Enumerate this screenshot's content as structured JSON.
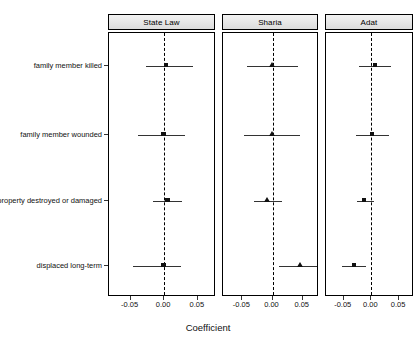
{
  "chart_data": {
    "type": "scatter",
    "title": "",
    "xlabel": "Coefficient",
    "ylabel": "",
    "xlim": [
      -0.082,
      0.077
    ],
    "xticks": [
      -0.05,
      0.0,
      0.05
    ],
    "xticklabels": [
      "-0.05",
      "0.00",
      "0.05"
    ],
    "grid": false,
    "legend": "none",
    "reference_line": {
      "value": 0.0,
      "style": "dashed",
      "color": "#000000"
    },
    "categories": [
      "family member killed",
      "family member wounded",
      "property destroyed or damaged",
      "displaced  long-term"
    ],
    "panels": [
      {
        "label": "State Law",
        "marker": "square",
        "points": [
          {
            "category": "family member killed",
            "estimate": 0.003,
            "low": -0.027,
            "high": 0.043
          },
          {
            "category": "family member wounded",
            "estimate": -0.001,
            "low": -0.039,
            "high": 0.031
          },
          {
            "category": "property destroyed or damaged",
            "estimate": 0.005,
            "low": -0.017,
            "high": 0.027
          },
          {
            "category": "displaced  long-term",
            "estimate": -0.001,
            "low": -0.046,
            "high": 0.025
          }
        ]
      },
      {
        "label": "Sharia",
        "marker": "triangle",
        "points": [
          {
            "category": "family member killed",
            "estimate": 0.0,
            "low": -0.042,
            "high": 0.043
          },
          {
            "category": "family member wounded",
            "estimate": 0.0,
            "low": -0.047,
            "high": 0.045
          },
          {
            "category": "property destroyed or damaged",
            "estimate": -0.008,
            "low": -0.03,
            "high": 0.016
          },
          {
            "category": "displaced  long-term",
            "estimate": 0.046,
            "low": 0.011,
            "high": 0.079
          }
        ]
      },
      {
        "label": "Adat",
        "marker": "square",
        "points": [
          {
            "category": "family member killed",
            "estimate": 0.007,
            "low": -0.022,
            "high": 0.036
          },
          {
            "category": "family member wounded",
            "estimate": 0.001,
            "low": -0.027,
            "high": 0.032
          },
          {
            "category": "property destroyed or damaged",
            "estimate": -0.013,
            "low": -0.026,
            "high": 0.004
          },
          {
            "category": "displaced  long-term",
            "estimate": -0.031,
            "low": -0.053,
            "high": -0.01
          }
        ]
      }
    ]
  },
  "axis": {
    "x_title": "Coefficient"
  }
}
